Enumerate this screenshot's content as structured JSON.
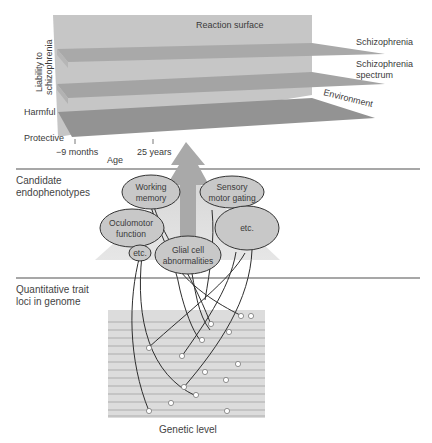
{
  "top_panel": {
    "reaction_surface_label": "Reaction surface",
    "y_axis_label_line1": "Liability to",
    "y_axis_label_line2": "schizophrenia",
    "y_harmful": "Harmful",
    "y_protective": "Protective",
    "x_ticks": [
      "−9 months",
      "25 years"
    ],
    "x_axis_label": "Age",
    "layers": [
      {
        "label": "Schizophrenia"
      },
      {
        "label_line1": "Schizophrenia",
        "label_line2": "spectrum"
      },
      {
        "label": "Environment"
      }
    ]
  },
  "middle_panel": {
    "section_label_line1": "Candidate",
    "section_label_line2": "endophenotypes",
    "endophenotypes": [
      {
        "id": "working-memory",
        "line1": "Working",
        "line2": "memory"
      },
      {
        "id": "sensory-motor-gating",
        "line1": "Sensory",
        "line2": "motor gating"
      },
      {
        "id": "oculomotor-function",
        "line1": "Oculomotor",
        "line2": "function"
      },
      {
        "id": "etc-right",
        "line1": "etc.",
        "line2": ""
      },
      {
        "id": "etc-small",
        "line1": "etc.",
        "line2": ""
      },
      {
        "id": "glial-cell-abnormalities",
        "line1": "Glial cell",
        "line2": "abnormalities"
      }
    ]
  },
  "bottom_panel": {
    "section_label_line1": "Quantitative trait",
    "section_label_line2": "loci in genome",
    "footer_label": "Genetic level",
    "chromosome_line_count": 13
  },
  "colors": {
    "back_wall": "#c4c4c4",
    "layer_top": "#aaaaaa",
    "layer_mid": "#a2a2a2",
    "layer_base": "#8f8f8f",
    "ellipse_fill": "#c8c8c8",
    "arrow": "#a9a9a9",
    "divider": "#8a8a8a",
    "genome_bg": "#dcdcdc"
  }
}
